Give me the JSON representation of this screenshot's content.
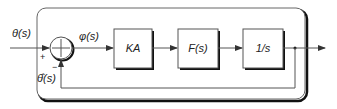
{
  "diagram": {
    "type": "feedback-control-block-diagram",
    "input_label": "θ(s)",
    "error_label": "φ(s)",
    "feedback_label": "θ̂(s)",
    "summing_junction": {
      "plus_sign": "+",
      "minus_sign": "−"
    },
    "blocks": [
      {
        "id": "gain",
        "label": "KA"
      },
      {
        "id": "filter",
        "label": "F(s)"
      },
      {
        "id": "integrator",
        "label": "1/s"
      }
    ],
    "colors": {
      "stroke": "#555555",
      "shadow": "#000000",
      "fill": "#ffffff"
    }
  }
}
